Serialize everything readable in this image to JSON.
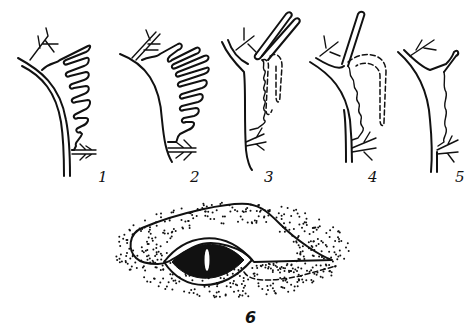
{
  "figure": {
    "panels": [
      {
        "id": "panel-1",
        "label": "1"
      },
      {
        "id": "panel-2",
        "label": "2"
      },
      {
        "id": "panel-3",
        "label": "3"
      },
      {
        "id": "panel-4",
        "label": "4"
      },
      {
        "id": "panel-5",
        "label": "5"
      },
      {
        "id": "panel-6",
        "label": "6"
      }
    ],
    "colors": {
      "ink": "#111111",
      "background": "#ffffff"
    }
  }
}
